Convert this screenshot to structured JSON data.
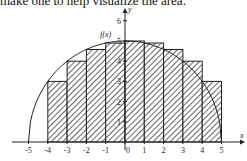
{
  "caption": "make one to help visualize the area.",
  "chart_data": {
    "type": "bar",
    "title": "",
    "function_label": "f(x)",
    "xlabel": "x",
    "ylabel": "y",
    "xlim": [
      -5,
      5
    ],
    "ylim": [
      0,
      6
    ],
    "x_ticks": [
      "-5",
      "-4",
      "-3",
      "-2",
      "-1",
      "0",
      "1",
      "2",
      "3",
      "4",
      "5"
    ],
    "y_ticks": [
      "1",
      "2",
      "3",
      "4",
      "5",
      "6"
    ],
    "categories": [
      "[-5,-4]",
      "[-4,-3]",
      "[-3,-2]",
      "[-2,-1]",
      "[-1,0]",
      "[0,1]",
      "[1,2]",
      "[2,3]",
      "[3,4]",
      "[4,5]"
    ],
    "values": [
      0,
      3,
      4,
      4.58,
      4.9,
      5,
      4.9,
      4.58,
      4,
      3
    ],
    "curve": "semicircle radius 5",
    "bar_fill": "diagonal hatch",
    "grid": false
  }
}
